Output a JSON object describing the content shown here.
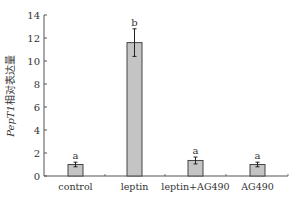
{
  "chart_data": {
    "type": "bar",
    "title": "",
    "xlabel": "",
    "ylabel": "PepT1相对表达量",
    "ylabel_italic_part": "PepT1",
    "ylabel_cn_part": "相对表达量",
    "ylim": [
      0,
      14
    ],
    "yticks": [
      0,
      2,
      4,
      6,
      8,
      10,
      12,
      14
    ],
    "ytick_labels": [
      "0",
      "2",
      "4",
      "6",
      "8",
      "10",
      "12",
      "14"
    ],
    "categories": [
      "control",
      "leptin",
      "leptin+AG490",
      "AG490"
    ],
    "values": [
      1.0,
      11.6,
      1.35,
      1.0
    ],
    "errors": [
      0.2,
      1.2,
      0.3,
      0.2
    ],
    "significance_letters": [
      "a",
      "b",
      "a",
      "a"
    ],
    "grid": false,
    "legend": null
  },
  "colors": {
    "bar_fill": "#c4c4c4",
    "bar_stroke": "#444444",
    "axis": "#555555",
    "text": "#333333"
  }
}
